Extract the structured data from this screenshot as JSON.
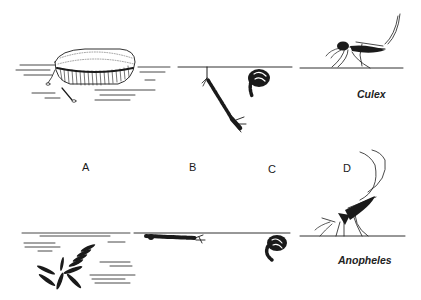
{
  "figure": {
    "stage_labels": [
      {
        "id": "A",
        "text": "A",
        "meaning": "eggs"
      },
      {
        "id": "B",
        "text": "B",
        "meaning": "larva"
      },
      {
        "id": "C",
        "text": "C",
        "meaning": "pupa"
      },
      {
        "id": "D",
        "text": "D",
        "meaning": "adult"
      }
    ],
    "rows": [
      {
        "species": "Culex",
        "eggs": "egg raft floating on water",
        "larva": "hanging at angle from surface via siphon",
        "pupa": "comma-shaped at surface",
        "adult": "body held parallel to surface"
      },
      {
        "species": "Anopheles",
        "eggs": "individual eggs with floats",
        "larva": "lying parallel beneath surface",
        "pupa": "comma-shaped at surface",
        "adult": "body held at angle to surface"
      }
    ],
    "colors": {
      "ink": "#1a1a1a",
      "background": "#ffffff"
    }
  }
}
